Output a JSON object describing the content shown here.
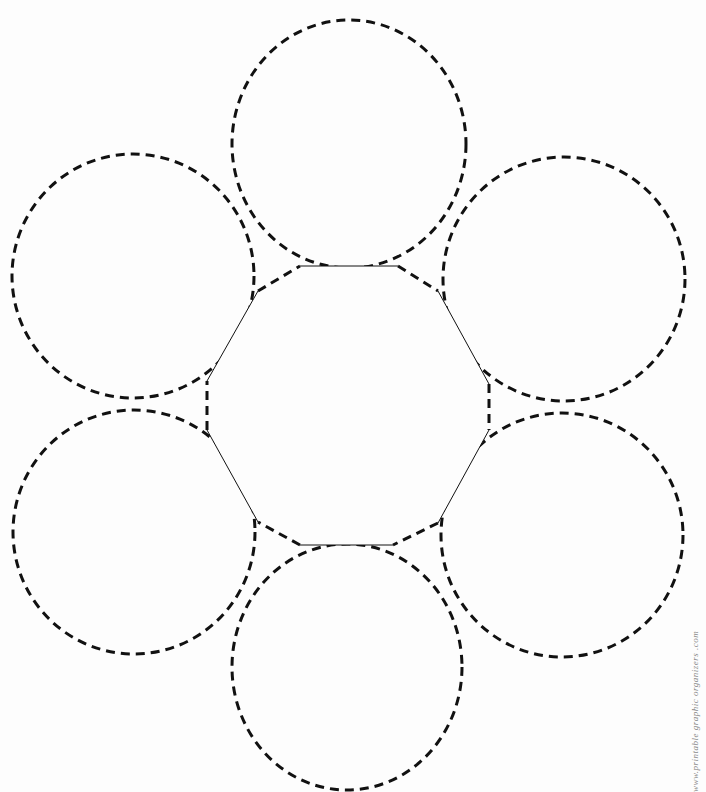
{
  "diagram": {
    "type": "graphic-organizer",
    "stroke_color": "#111111",
    "background": "#fdfdfd",
    "center_polygon": {
      "vertices": [
        [
          300,
          266
        ],
        [
          398,
          266
        ],
        [
          438,
          291
        ],
        [
          489,
          384
        ],
        [
          489,
          430
        ],
        [
          438,
          523
        ],
        [
          393,
          545
        ],
        [
          300,
          545
        ],
        [
          258,
          522
        ],
        [
          207,
          430
        ],
        [
          207,
          381
        ],
        [
          258,
          291
        ]
      ],
      "solid_edge_stroke": 1,
      "dashed_edge_stroke": 3
    },
    "circles": [
      {
        "name": "top",
        "cx": 349,
        "cy": 144,
        "rx": 117,
        "ry": 124
      },
      {
        "name": "top-right",
        "cx": 564,
        "cy": 279,
        "rx": 121,
        "ry": 122
      },
      {
        "name": "bottom-right",
        "cx": 562,
        "cy": 535,
        "rx": 121,
        "ry": 122
      },
      {
        "name": "bottom",
        "cx": 347,
        "cy": 667,
        "rx": 115,
        "ry": 123
      },
      {
        "name": "bottom-left",
        "cx": 134,
        "cy": 532,
        "rx": 121,
        "ry": 122
      },
      {
        "name": "top-left",
        "cx": 133,
        "cy": 276,
        "rx": 121,
        "ry": 122
      }
    ]
  },
  "credit_text": "www.printable graphic organizers .com"
}
